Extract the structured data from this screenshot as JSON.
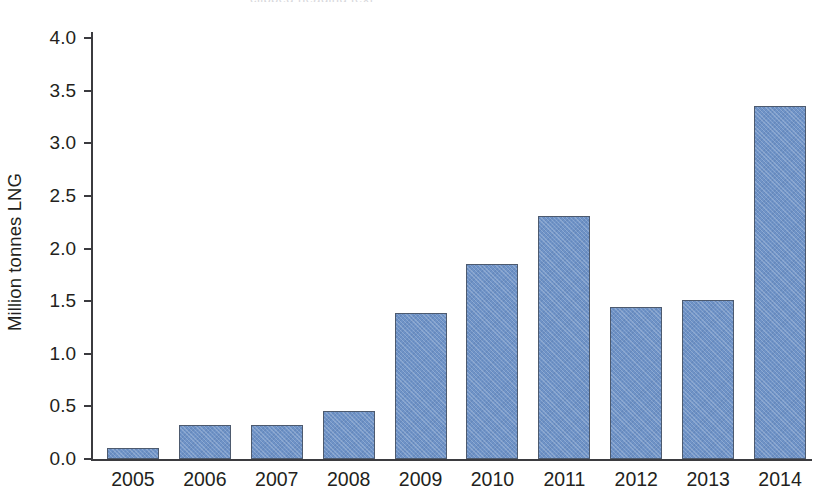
{
  "chart_data": {
    "type": "bar",
    "title": "",
    "xlabel": "",
    "ylabel": "Million tonnes LNG",
    "categories": [
      "2005",
      "2006",
      "2007",
      "2008",
      "2009",
      "2010",
      "2011",
      "2012",
      "2013",
      "2014"
    ],
    "values": [
      0.1,
      0.32,
      0.32,
      0.46,
      1.39,
      1.85,
      2.31,
      1.44,
      1.51,
      3.35
    ],
    "ylim": [
      0.0,
      4.0
    ],
    "ytick_labels": [
      "0.0",
      "0.5",
      "1.0",
      "1.5",
      "2.0",
      "2.5",
      "3.0",
      "3.5",
      "4.0"
    ],
    "ytick_values": [
      0.0,
      0.5,
      1.0,
      1.5,
      2.0,
      2.5,
      3.0,
      3.5,
      4.0
    ],
    "grid": false,
    "legend": null,
    "series": [
      {
        "name": "LNG",
        "values": [
          0.1,
          0.32,
          0.32,
          0.46,
          1.39,
          1.85,
          2.31,
          1.44,
          1.51,
          3.35
        ],
        "color": "#6f93c7",
        "edge_color": "#4d5a6e"
      }
    ]
  },
  "axes": {
    "axis_color": "#3b3b3f",
    "text_color": "#231f20"
  },
  "title_remnant": "clipped heading text"
}
